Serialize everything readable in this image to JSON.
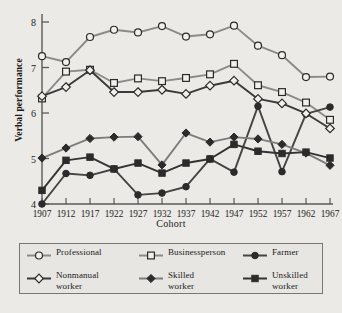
{
  "chart_data": {
    "type": "line",
    "title": "",
    "xlabel": "Cohort",
    "ylabel": "Verbal performance",
    "categories": [
      "1907",
      "1912",
      "1917",
      "1922",
      "1927",
      "1932",
      "1937",
      "1942",
      "1947",
      "1952",
      "1957",
      "1962",
      "1967"
    ],
    "xlim": [
      "1907",
      "1967"
    ],
    "ylim": [
      4,
      8
    ],
    "yticks": [
      "4",
      "5",
      "6",
      "7",
      "8"
    ],
    "grid": false,
    "legend_position": "below-plot",
    "series": [
      {
        "name": "Professional",
        "marker": "open-circle",
        "color": "#8a8a8a",
        "values": [
          7.25,
          7.12,
          7.67,
          7.83,
          7.77,
          7.91,
          7.68,
          7.73,
          7.92,
          7.48,
          7.27,
          6.79,
          6.8
        ]
      },
      {
        "name": "Businessperson",
        "marker": "open-square",
        "color": "#8a8a8a",
        "values": [
          6.32,
          6.91,
          6.95,
          6.66,
          6.76,
          6.7,
          6.77,
          6.85,
          7.08,
          6.61,
          6.46,
          6.23,
          5.85
        ]
      },
      {
        "name": "Farmer",
        "marker": "filled-circle",
        "color": "#444444",
        "values": [
          4.0,
          4.67,
          4.63,
          4.77,
          4.2,
          4.24,
          4.38,
          4.99,
          4.7,
          6.15,
          4.71,
          5.98,
          6.13
        ]
      },
      {
        "name": "Nonmanual worker",
        "marker": "open-diamond",
        "color": "#3a3a3a",
        "values": [
          6.37,
          6.57,
          6.94,
          6.46,
          6.46,
          6.51,
          6.42,
          6.6,
          6.71,
          6.31,
          6.21,
          5.99,
          5.66
        ]
      },
      {
        "name": "Skilled worker",
        "marker": "filled-diamond",
        "color": "#7d7d7d",
        "values": [
          5.01,
          5.23,
          5.44,
          5.47,
          5.48,
          4.86,
          5.56,
          5.36,
          5.47,
          5.43,
          5.31,
          5.12,
          4.85
        ]
      },
      {
        "name": "Unskilled worker",
        "marker": "filled-square",
        "color": "#333333",
        "values": [
          4.3,
          4.96,
          5.03,
          4.77,
          4.9,
          4.68,
          4.9,
          4.99,
          5.31,
          5.16,
          5.11,
          5.14,
          5.01
        ]
      }
    ]
  },
  "legend": {
    "items": [
      {
        "label": "Professional",
        "marker": "open-circle",
        "color": "#8a8a8a"
      },
      {
        "label": "Businessperson",
        "marker": "open-square",
        "color": "#8a8a8a"
      },
      {
        "label": "Farmer",
        "marker": "filled-circle",
        "color": "#444444"
      },
      {
        "label": "Nonmanual\nworker",
        "marker": "open-diamond",
        "color": "#3a3a3a"
      },
      {
        "label": "Skilled\nworker",
        "marker": "filled-diamond",
        "color": "#7d7d7d"
      },
      {
        "label": "Unskilled\nworker",
        "marker": "filled-square",
        "color": "#333333"
      }
    ]
  }
}
